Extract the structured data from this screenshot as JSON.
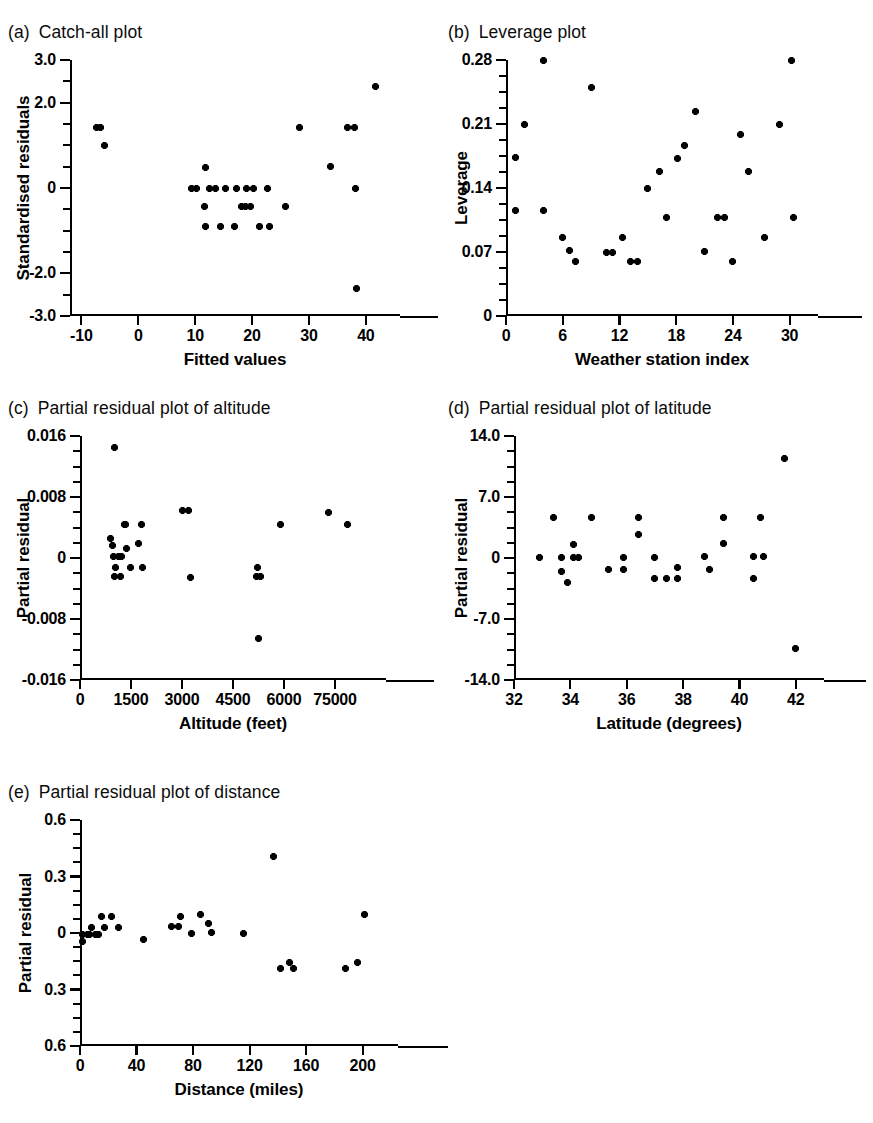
{
  "figure": {
    "panels": [
      {
        "tag": "(a)",
        "title": "Catch-all plot",
        "chart_data": {
          "type": "scatter",
          "title": "Catch-all plot",
          "xlabel": "Fitted values",
          "ylabel": "Standardised residuals",
          "xlim": [
            -12,
            46
          ],
          "ylim": [
            -3.0,
            3.0
          ],
          "xticks": [
            -10,
            0,
            10,
            20,
            30,
            40
          ],
          "xticklabels": [
            "-10",
            "0",
            "10",
            "20",
            "30",
            "40"
          ],
          "yticks": [
            3.0,
            2.0,
            0,
            -2.0,
            -3.0
          ],
          "yticklabels": [
            "3.0",
            "2.0",
            "0",
            "-2.0",
            "-3.0"
          ],
          "grid": false,
          "legend": false,
          "marker": "star",
          "points": [
            {
              "x": -7.4,
              "y": 1.42
            },
            {
              "x": -6.6,
              "y": 1.42
            },
            {
              "x": -6.0,
              "y": 1.0
            },
            {
              "x": 9.3,
              "y": 0.0
            },
            {
              "x": 10.2,
              "y": 0.0
            },
            {
              "x": 11.6,
              "y": -0.44
            },
            {
              "x": 11.8,
              "y": 0.48
            },
            {
              "x": 11.9,
              "y": -0.9
            },
            {
              "x": 12.6,
              "y": 0.0
            },
            {
              "x": 13.5,
              "y": 0.0
            },
            {
              "x": 14.5,
              "y": -0.9
            },
            {
              "x": 15.4,
              "y": 0.0
            },
            {
              "x": 16.9,
              "y": -0.9
            },
            {
              "x": 17.3,
              "y": 0.0
            },
            {
              "x": 18.2,
              "y": -0.44
            },
            {
              "x": 18.9,
              "y": -0.44
            },
            {
              "x": 19.1,
              "y": 0.0
            },
            {
              "x": 19.7,
              "y": -0.44
            },
            {
              "x": 20.3,
              "y": 0.0
            },
            {
              "x": 21.3,
              "y": -0.9
            },
            {
              "x": 22.7,
              "y": 0.0
            },
            {
              "x": 23.0,
              "y": -0.9
            },
            {
              "x": 25.8,
              "y": -0.44
            },
            {
              "x": 28.3,
              "y": 1.42
            },
            {
              "x": 33.8,
              "y": 0.5
            },
            {
              "x": 36.8,
              "y": 1.42
            },
            {
              "x": 38.0,
              "y": 1.42
            },
            {
              "x": 38.1,
              "y": 0.0
            },
            {
              "x": 38.3,
              "y": -2.35
            },
            {
              "x": 41.7,
              "y": 2.38
            }
          ]
        }
      },
      {
        "tag": "(b)",
        "title": "Leverage plot",
        "chart_data": {
          "type": "scatter",
          "title": "Leverage plot",
          "xlabel": "Weather station index",
          "ylabel": "Leverage",
          "xlim": [
            0,
            33
          ],
          "ylim": [
            0,
            0.28
          ],
          "xticks": [
            0,
            6,
            12,
            18,
            24,
            30
          ],
          "xticklabels": [
            "0",
            "6",
            "12",
            "18",
            "24",
            "30"
          ],
          "yticks": [
            0.28,
            0.21,
            0.14,
            0.07,
            0
          ],
          "yticklabels": [
            "0.28",
            "0.21",
            "0.14",
            "0.07",
            "0"
          ],
          "grid": false,
          "legend": false,
          "marker": "star",
          "points": [
            {
              "x": 1,
              "y": 0.173
            },
            {
              "x": 1,
              "y": 0.115
            },
            {
              "x": 2,
              "y": 0.21
            },
            {
              "x": 4,
              "y": 0.28
            },
            {
              "x": 4,
              "y": 0.115
            },
            {
              "x": 6,
              "y": 0.086
            },
            {
              "x": 6.7,
              "y": 0.072
            },
            {
              "x": 7.3,
              "y": 0.06
            },
            {
              "x": 9,
              "y": 0.25
            },
            {
              "x": 10.6,
              "y": 0.07
            },
            {
              "x": 11.3,
              "y": 0.07
            },
            {
              "x": 12.3,
              "y": 0.086
            },
            {
              "x": 13.2,
              "y": 0.06
            },
            {
              "x": 13.9,
              "y": 0.06
            },
            {
              "x": 15,
              "y": 0.14
            },
            {
              "x": 16.2,
              "y": 0.158
            },
            {
              "x": 17,
              "y": 0.108
            },
            {
              "x": 18.1,
              "y": 0.172
            },
            {
              "x": 18.9,
              "y": 0.186
            },
            {
              "x": 20,
              "y": 0.224
            },
            {
              "x": 21,
              "y": 0.071
            },
            {
              "x": 22.4,
              "y": 0.108
            },
            {
              "x": 23.1,
              "y": 0.108
            },
            {
              "x": 24,
              "y": 0.06
            },
            {
              "x": 24.8,
              "y": 0.199
            },
            {
              "x": 25.6,
              "y": 0.158
            },
            {
              "x": 27.3,
              "y": 0.086
            },
            {
              "x": 28.9,
              "y": 0.21
            },
            {
              "x": 30.2,
              "y": 0.28
            },
            {
              "x": 30.4,
              "y": 0.108
            }
          ]
        }
      },
      {
        "tag": "(c)",
        "title": "Partial residual plot of altitude",
        "chart_data": {
          "type": "scatter",
          "title": "Partial residual plot of altitude",
          "xlabel": "Altitude (feet)",
          "ylabel": "Partial residual",
          "xlim": [
            0,
            9000
          ],
          "ylim": [
            -0.016,
            0.016
          ],
          "xticks": [
            0,
            1500,
            3000,
            4500,
            6000,
            7500
          ],
          "xticklabels": [
            "0",
            "1500",
            "3000",
            "4500",
            "6000",
            "75000"
          ],
          "yticks": [
            0.016,
            0.008,
            0,
            -0.008,
            -0.016
          ],
          "yticklabels": [
            "0.016",
            "0.008",
            "0",
            "-0.008",
            "-0.016"
          ],
          "grid": false,
          "legend": false,
          "marker": "star",
          "points": [
            {
              "x": 1020,
              "y": 0.0145
            },
            {
              "x": 900,
              "y": 0.0026
            },
            {
              "x": 950,
              "y": 0.0016
            },
            {
              "x": 980,
              "y": 0.0002
            },
            {
              "x": 1130,
              "y": 0.0002
            },
            {
              "x": 1230,
              "y": 0.0002
            },
            {
              "x": 1050,
              "y": -0.0012
            },
            {
              "x": 1010,
              "y": -0.0024
            },
            {
              "x": 1180,
              "y": -0.0024
            },
            {
              "x": 1300,
              "y": 0.0044
            },
            {
              "x": 1330,
              "y": 0.0044
            },
            {
              "x": 1360,
              "y": 0.0012
            },
            {
              "x": 1480,
              "y": -0.0012
            },
            {
              "x": 1800,
              "y": 0.0044
            },
            {
              "x": 1720,
              "y": 0.0019
            },
            {
              "x": 1830,
              "y": -0.0012
            },
            {
              "x": 3010,
              "y": 0.0062
            },
            {
              "x": 3180,
              "y": 0.0062
            },
            {
              "x": 3240,
              "y": -0.0025
            },
            {
              "x": 5220,
              "y": -0.0012
            },
            {
              "x": 5180,
              "y": -0.0024
            },
            {
              "x": 5300,
              "y": -0.0024
            },
            {
              "x": 5240,
              "y": -0.0105
            },
            {
              "x": 5900,
              "y": 0.0044
            },
            {
              "x": 7320,
              "y": 0.006
            },
            {
              "x": 7880,
              "y": 0.0044
            }
          ]
        }
      },
      {
        "tag": "(d)",
        "title": "Partial residual plot of latitude",
        "chart_data": {
          "type": "scatter",
          "title": "Partial residual plot of latitude",
          "xlabel": "Latitude (degrees)",
          "ylabel": "Partial residual",
          "xlim": [
            32,
            43
          ],
          "ylim": [
            -14.0,
            14.0
          ],
          "xticks": [
            32,
            34,
            36,
            38,
            40,
            42
          ],
          "xticklabels": [
            "32",
            "34",
            "36",
            "38",
            "40",
            "42"
          ],
          "yticks": [
            14.0,
            7.0,
            0,
            -7.0,
            -14.0
          ],
          "yticklabels": [
            "14.0",
            "7.0",
            "0",
            "-7.0",
            "-14.0"
          ],
          "grid": false,
          "legend": false,
          "marker": "star",
          "points": [
            {
              "x": 32.9,
              "y": 0.1
            },
            {
              "x": 33.4,
              "y": 4.6
            },
            {
              "x": 33.7,
              "y": 0.1
            },
            {
              "x": 33.7,
              "y": -1.5
            },
            {
              "x": 33.9,
              "y": -2.8
            },
            {
              "x": 34.1,
              "y": 1.6
            },
            {
              "x": 34.1,
              "y": 0.1
            },
            {
              "x": 34.3,
              "y": 0.1
            },
            {
              "x": 34.75,
              "y": 4.6
            },
            {
              "x": 35.35,
              "y": -1.3
            },
            {
              "x": 35.9,
              "y": 0.1
            },
            {
              "x": 35.9,
              "y": -1.3
            },
            {
              "x": 36.4,
              "y": 4.6
            },
            {
              "x": 36.4,
              "y": 2.7
            },
            {
              "x": 37.0,
              "y": 0.1
            },
            {
              "x": 37.0,
              "y": -2.4
            },
            {
              "x": 37.4,
              "y": -2.4
            },
            {
              "x": 37.8,
              "y": -1.1
            },
            {
              "x": 37.8,
              "y": -2.4
            },
            {
              "x": 38.75,
              "y": 0.2
            },
            {
              "x": 38.95,
              "y": -1.3
            },
            {
              "x": 39.45,
              "y": 4.6
            },
            {
              "x": 39.45,
              "y": 1.7
            },
            {
              "x": 40.5,
              "y": 0.2
            },
            {
              "x": 40.5,
              "y": -2.4
            },
            {
              "x": 40.75,
              "y": 4.6
            },
            {
              "x": 40.85,
              "y": 0.2
            },
            {
              "x": 41.6,
              "y": 11.4
            },
            {
              "x": 42.0,
              "y": -10.4
            }
          ]
        }
      },
      {
        "tag": "(e)",
        "title": "Partial residual plot of distance",
        "chart_data": {
          "type": "scatter",
          "title": "Partial residual plot of distance",
          "xlabel": "Distance (miles)",
          "ylabel": "Partial residual",
          "xlim": [
            0,
            225
          ],
          "ylim": [
            -0.6,
            0.6
          ],
          "xticks": [
            0,
            40,
            80,
            120,
            160,
            200
          ],
          "xticklabels": [
            "0",
            "40",
            "80",
            "120",
            "160",
            "200"
          ],
          "yticks": [
            0.6,
            0.3,
            0,
            -0.3,
            -0.6
          ],
          "yticklabels": [
            "0.6",
            "0.3",
            "0",
            "0.3",
            "0.6"
          ],
          "grid": false,
          "legend": false,
          "marker": "star",
          "points": [
            {
              "x": 2,
              "y": -0.007
            },
            {
              "x": 2,
              "y": -0.045
            },
            {
              "x": 5,
              "y": -0.007
            },
            {
              "x": 7,
              "y": -0.007
            },
            {
              "x": 8,
              "y": 0.03
            },
            {
              "x": 11,
              "y": -0.007
            },
            {
              "x": 13,
              "y": -0.007
            },
            {
              "x": 15,
              "y": 0.09
            },
            {
              "x": 17,
              "y": 0.03
            },
            {
              "x": 22,
              "y": 0.09
            },
            {
              "x": 27,
              "y": 0.03
            },
            {
              "x": 45,
              "y": -0.035
            },
            {
              "x": 65,
              "y": 0.035
            },
            {
              "x": 70,
              "y": 0.035
            },
            {
              "x": 71,
              "y": 0.09
            },
            {
              "x": 79,
              "y": -0.005
            },
            {
              "x": 85,
              "y": 0.1
            },
            {
              "x": 91,
              "y": 0.05
            },
            {
              "x": 93,
              "y": 0.005
            },
            {
              "x": 116,
              "y": -0.002
            },
            {
              "x": 137,
              "y": 0.405
            },
            {
              "x": 142,
              "y": -0.19
            },
            {
              "x": 148,
              "y": -0.155
            },
            {
              "x": 151,
              "y": -0.19
            },
            {
              "x": 188,
              "y": -0.19
            },
            {
              "x": 196,
              "y": -0.155
            },
            {
              "x": 201,
              "y": 0.1
            }
          ]
        }
      }
    ]
  }
}
